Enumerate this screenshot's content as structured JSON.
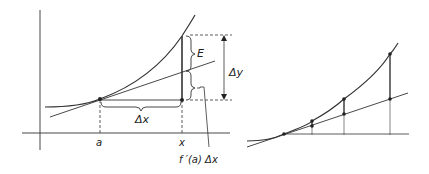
{
  "left_panel": {
    "labels": {
      "a": "a",
      "x": "x",
      "delta_x": "Δx",
      "delta_y": "Δy",
      "E": "E",
      "differential": "f ′(a) Δx"
    }
  },
  "right_panel": {
    "description": "Curve and tangent line with vertical segments at three increasing x positions showing error growth"
  },
  "colors": {
    "stroke": "#333333",
    "background": "#ffffff"
  }
}
